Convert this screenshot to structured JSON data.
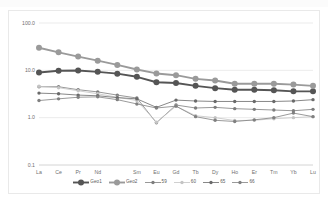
{
  "chart_data": {
    "type": "line",
    "title": "",
    "subtitle": "",
    "xlabel": "",
    "ylabel": "",
    "yscale": "log",
    "ylim": [
      0.1,
      100.0
    ],
    "ytick_labels": [
      "100.0",
      "10.0",
      "1.0",
      "0.1"
    ],
    "ytick_values": [
      100.0,
      10.0,
      1.0,
      0.1
    ],
    "grid": true,
    "grid_axis": "y",
    "legend_position": "bottom",
    "categories": [
      "La",
      "Ce",
      "Pr",
      "Nd",
      "",
      "Sm",
      "Eu",
      "Gd",
      "Tb",
      "Dy",
      "Ho",
      "Er",
      "Tm",
      "Yb",
      "Lu"
    ],
    "series": [
      {
        "name": "Geo1",
        "color": "#555555",
        "width": 1.9,
        "marker": "circle",
        "marker_size": 3.0,
        "values": [
          9.0,
          9.8,
          9.9,
          9.3,
          8.5,
          7.3,
          5.6,
          5.4,
          4.7,
          4.2,
          3.9,
          3.9,
          3.8,
          3.6,
          3.6
        ]
      },
      {
        "name": "Geo2",
        "color": "#9a9a9a",
        "width": 1.9,
        "marker": "circle",
        "marker_size": 3.0,
        "values": [
          30.0,
          24.0,
          19.5,
          16.0,
          13.0,
          10.4,
          8.6,
          7.9,
          6.6,
          6.1,
          5.2,
          5.2,
          5.2,
          5.0,
          4.7
        ]
      },
      {
        "name": "59",
        "color": "#7d7d7d",
        "width": 0.8,
        "marker": "circle",
        "marker_size": 1.7,
        "values": [
          4.5,
          4.5,
          3.9,
          3.5,
          3.0,
          2.6,
          0.78,
          1.85,
          1.6,
          1.65,
          1.55,
          1.5,
          1.45,
          1.4,
          1.5
        ]
      },
      {
        "name": "60",
        "color": "#c4c4c4",
        "width": 0.8,
        "marker": "circle",
        "marker_size": 1.7,
        "values": [
          4.6,
          4.3,
          3.7,
          3.2,
          2.7,
          2.3,
          0.8,
          1.75,
          1.1,
          1.0,
          0.87,
          0.88,
          0.95,
          1.0,
          1.05
        ]
      },
      {
        "name": "65",
        "color": "#6a6a6a",
        "width": 0.8,
        "marker": "circle",
        "marker_size": 1.7,
        "values": [
          3.3,
          3.2,
          3.0,
          2.9,
          2.65,
          2.5,
          1.65,
          2.35,
          2.25,
          2.2,
          2.2,
          2.2,
          2.2,
          2.25,
          2.4
        ]
      },
      {
        "name": "66",
        "color": "#808080",
        "width": 0.8,
        "marker": "circle",
        "marker_size": 1.7,
        "values": [
          2.3,
          2.5,
          2.7,
          2.75,
          2.4,
          1.95,
          1.6,
          1.75,
          1.05,
          0.88,
          0.83,
          0.9,
          1.0,
          1.25,
          1.05
        ]
      }
    ]
  },
  "legend": {
    "items": [
      {
        "label": "Geo1"
      },
      {
        "label": "Geo2"
      },
      {
        "label": "59"
      },
      {
        "label": "60"
      },
      {
        "label": "65"
      },
      {
        "label": "66"
      }
    ]
  }
}
